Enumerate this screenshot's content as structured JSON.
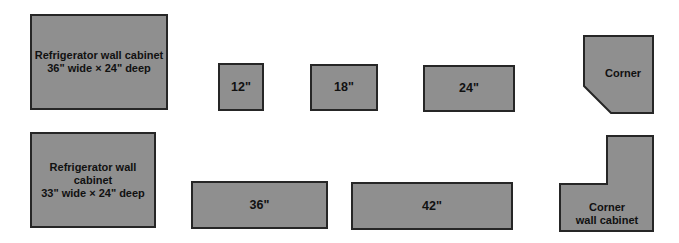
{
  "diagram": {
    "colors": {
      "fill": "#8f8f8f",
      "stroke": "#262626",
      "text": "#111111",
      "background": "#ffffff"
    },
    "cabinets": [
      {
        "id": "fridge-36",
        "shape": "rectangle",
        "lines": [
          "Refrigerator wall cabinet",
          "36\" wide × 24\" deep"
        ],
        "box": [
          30,
          14,
          168,
          110
        ]
      },
      {
        "id": "fridge-33",
        "shape": "rectangle",
        "lines": [
          "Refrigerator wall cabinet",
          "33\" wide × 24\" deep"
        ],
        "box": [
          30,
          132,
          156,
          228
        ]
      },
      {
        "id": "w12",
        "shape": "rectangle",
        "lines": [
          "12\""
        ],
        "box": [
          218,
          63,
          264,
          111
        ]
      },
      {
        "id": "w18",
        "shape": "rectangle",
        "lines": [
          "18\""
        ],
        "box": [
          310,
          64,
          378,
          111
        ]
      },
      {
        "id": "w24",
        "shape": "rectangle",
        "lines": [
          "24\""
        ],
        "box": [
          423,
          65,
          515,
          112
        ]
      },
      {
        "id": "w36",
        "shape": "rectangle",
        "lines": [
          "36\""
        ],
        "box": [
          191,
          181,
          328,
          229
        ]
      },
      {
        "id": "w42",
        "shape": "rectangle",
        "lines": [
          "42\""
        ],
        "box": [
          351,
          182,
          513,
          230
        ]
      },
      {
        "id": "corner",
        "shape": "chamfered-pentagon",
        "lines": [
          "Corner"
        ],
        "points": [
          [
            584,
            36
          ],
          [
            653,
            36
          ],
          [
            653,
            113
          ],
          [
            611,
            113
          ],
          [
            584,
            86
          ]
        ]
      },
      {
        "id": "corner-wall",
        "shape": "L-shape",
        "lines": [
          "Corner",
          "wall cabinet"
        ],
        "points": [
          [
            607,
            136
          ],
          [
            653,
            136
          ],
          [
            653,
            231
          ],
          [
            560,
            231
          ],
          [
            560,
            184
          ],
          [
            607,
            184
          ]
        ]
      }
    ]
  }
}
